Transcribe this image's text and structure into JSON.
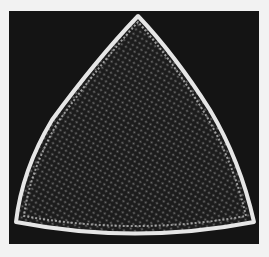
{
  "image": {
    "subject": "triangular diatom micrograph",
    "background_color": "#141414",
    "border_color": "#f2f2f2",
    "outline_color": "#e8e8e8",
    "interior_color": "#1c1c1c",
    "pore_color": "#9a9a9a"
  }
}
